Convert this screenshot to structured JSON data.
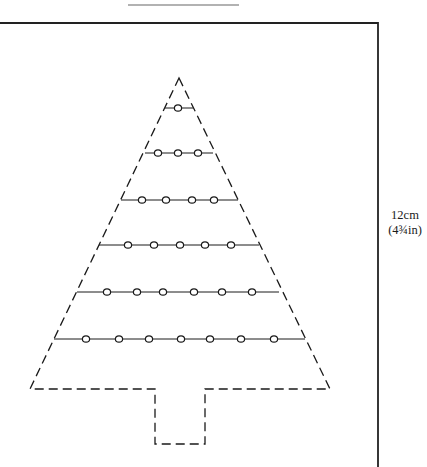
{
  "figure": {
    "type": "christmas-tree-template",
    "colors": {
      "ink": "#1a1a1a",
      "frame": "#222222",
      "rule": "#999999",
      "background": "#ffffff"
    },
    "header_rule": {
      "x1": 128,
      "x2": 239,
      "y": 5
    },
    "frame": {
      "left": 0,
      "top": 23,
      "right": 378,
      "bottom": 467
    },
    "dimension_label": {
      "metric": "12cm",
      "imperial": "(4¾in)"
    },
    "tree": {
      "apex": [
        179,
        78
      ],
      "base_left": [
        30,
        389
      ],
      "base_right": [
        330,
        389
      ],
      "trunk": {
        "left": 155,
        "right": 205,
        "bottom": 444
      },
      "outline_style": "dashed"
    },
    "bead_rows": [
      {
        "y": 108,
        "x1": 165,
        "x2": 193,
        "beads": [
          178
        ]
      },
      {
        "y": 153,
        "x1": 145,
        "x2": 213,
        "beads": [
          158,
          178,
          198
        ]
      },
      {
        "y": 200,
        "x1": 121,
        "x2": 238,
        "beads": [
          142,
          166,
          192,
          214
        ]
      },
      {
        "y": 245,
        "x1": 99,
        "x2": 259,
        "beads": [
          128,
          154,
          180,
          205,
          231
        ]
      },
      {
        "y": 292,
        "x1": 77,
        "x2": 279,
        "beads": [
          107,
          137,
          163,
          194,
          222,
          252
        ]
      },
      {
        "y": 339,
        "x1": 54,
        "x2": 305,
        "beads": [
          86,
          119,
          149,
          181,
          210,
          241,
          274
        ]
      }
    ]
  }
}
